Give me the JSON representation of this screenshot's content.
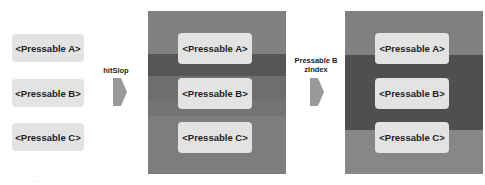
{
  "left_column": {
    "buttons": [
      "<Pressable A>",
      "<Pressable B>",
      "<Pressable C>"
    ]
  },
  "transition_1": {
    "label": "hitSlop",
    "arrow_icon": "arrow-right-icon"
  },
  "panel_1": {
    "background": "#818181",
    "bands": [
      {
        "name": "hitslop-a",
        "color": "#818181"
      },
      {
        "name": "hitslop-a-b-overlap",
        "color": "#565656"
      },
      {
        "name": "hitslop-b",
        "color": "#6e6e6e"
      },
      {
        "name": "hitslop-b-c-overlap",
        "color": "#747474"
      },
      {
        "name": "hitslop-c",
        "color": "#7d7d7d"
      }
    ],
    "buttons": [
      "<Pressable A>",
      "<Pressable B>",
      "<Pressable C>"
    ]
  },
  "transition_2": {
    "label_line1": "Pressable B",
    "label_line2": "zIndex",
    "arrow_icon": "arrow-right-icon"
  },
  "panel_2": {
    "background": "#818181",
    "bands": [
      {
        "name": "hitslop-a",
        "color": "#818181"
      },
      {
        "name": "hitslop-b-raised",
        "color": "#4f4f4f"
      },
      {
        "name": "hitslop-c",
        "color": "#878787"
      }
    ],
    "buttons": [
      "<Pressable A>",
      "<Pressable B>",
      "<Pressable C>"
    ]
  },
  "caption": "  · · ··   ······ ·"
}
